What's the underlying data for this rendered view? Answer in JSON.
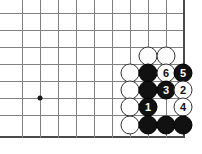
{
  "diagram": {
    "board": {
      "background_color": "#ffffff",
      "line_color": "#808080",
      "edge_color": "#4a4a4a",
      "vertical_lines_x": [
        22,
        40,
        58,
        76,
        94,
        112,
        130,
        148,
        166,
        183
      ],
      "horizontal_lines_y": [
        13,
        30,
        47,
        64,
        81,
        98,
        115,
        136
      ],
      "right_edge_index": 9,
      "bottom_edge_index": 7,
      "star_points": [
        {
          "x": 40,
          "y": 98
        }
      ]
    },
    "stones": [
      {
        "name": "white-stone-1",
        "color": "white",
        "x": 148,
        "y": 56,
        "label": ""
      },
      {
        "name": "white-stone-2",
        "color": "white",
        "x": 166,
        "y": 56,
        "label": ""
      },
      {
        "name": "white-stone-3",
        "color": "white",
        "x": 130,
        "y": 73,
        "label": ""
      },
      {
        "name": "black-stone-1",
        "color": "black",
        "x": 148,
        "y": 73,
        "label": ""
      },
      {
        "name": "white-move-6",
        "color": "white",
        "x": 166,
        "y": 73,
        "label": "6"
      },
      {
        "name": "black-move-5",
        "color": "black",
        "x": 183,
        "y": 73,
        "label": "5"
      },
      {
        "name": "white-stone-4",
        "color": "white",
        "x": 130,
        "y": 90,
        "label": ""
      },
      {
        "name": "black-stone-2",
        "color": "black",
        "x": 148,
        "y": 90,
        "label": ""
      },
      {
        "name": "black-move-3",
        "color": "black",
        "x": 166,
        "y": 90,
        "label": "3"
      },
      {
        "name": "white-move-2",
        "color": "white",
        "x": 183,
        "y": 90,
        "label": "2"
      },
      {
        "name": "white-stone-5",
        "color": "white",
        "x": 130,
        "y": 107,
        "label": ""
      },
      {
        "name": "black-move-1",
        "color": "black",
        "x": 148,
        "y": 107,
        "label": "1"
      },
      {
        "name": "white-move-4",
        "color": "white",
        "x": 183,
        "y": 107,
        "label": "4"
      },
      {
        "name": "white-stone-6",
        "color": "white",
        "x": 130,
        "y": 125,
        "label": ""
      },
      {
        "name": "black-stone-3",
        "color": "black",
        "x": 148,
        "y": 125,
        "label": ""
      },
      {
        "name": "black-stone-4",
        "color": "black",
        "x": 166,
        "y": 125,
        "label": ""
      },
      {
        "name": "black-stone-5",
        "color": "black",
        "x": 183,
        "y": 125,
        "label": ""
      }
    ],
    "colors": {
      "black_stone": "#111111",
      "white_stone": "#ffffff",
      "white_stone_border": "#333333",
      "black_label": "#ffffff",
      "white_label": "#111111"
    }
  }
}
